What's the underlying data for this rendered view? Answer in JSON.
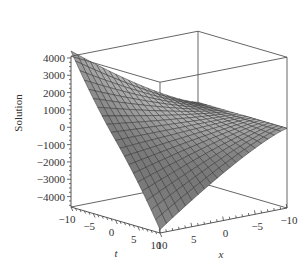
{
  "chart_data": {
    "type": "surface3d",
    "title": "",
    "xlabel": "x",
    "ylabel": "t",
    "zlabel": "Solution",
    "t_ticks": [
      -10,
      -5,
      0,
      5,
      10
    ],
    "t_tick_labels": [
      "−10",
      "−5",
      "0",
      "5",
      "10"
    ],
    "x_ticks": [
      10,
      5,
      0,
      -5,
      -10
    ],
    "x_tick_labels": [
      "10",
      "5",
      "0",
      "−5",
      "−10"
    ],
    "z_ticks": [
      4000,
      3000,
      2000,
      1000,
      0,
      -1000,
      -2000,
      -3000,
      -4000
    ],
    "z_tick_labels": [
      "4000",
      "3000",
      "2000",
      "1000",
      "0",
      "−1000",
      "−2000",
      "−3000",
      "−4000"
    ],
    "t_range": [
      -10,
      10
    ],
    "x_range": [
      -10,
      10
    ],
    "zlim": [
      -4600,
      4100
    ],
    "grid": false,
    "legend": null,
    "surface": {
      "description": "Wireframe-shaded surface; highest at t=-10,x=10 (~4400), lowest at t=10,x=10 (~-4400), near 0 along x=-10",
      "grid_n": 20,
      "corner_values": {
        "t-10_x10": 4400,
        "t10_x10": -4400,
        "t-10_x-10": 0,
        "t10_x-10": 0
      },
      "fill_color": "#9a9a9a",
      "line_color": "#333333"
    },
    "box_color": "#555555"
  }
}
